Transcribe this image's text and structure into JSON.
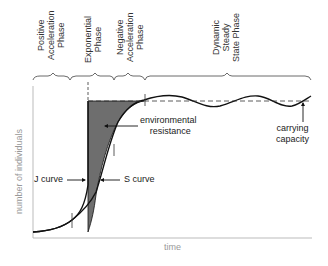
{
  "diagram": {
    "phases": [
      {
        "id": "positive-acceleration",
        "lines": [
          "Positive",
          "Acceleration",
          "Phase"
        ]
      },
      {
        "id": "exponential",
        "lines": [
          "Exponential",
          "Phase"
        ]
      },
      {
        "id": "negative-acceleration",
        "lines": [
          "Negative",
          "Acceleration",
          "Phase"
        ]
      },
      {
        "id": "dynamic-steady-state",
        "lines": [
          "Dynamic",
          "Steady",
          "State Phase"
        ]
      }
    ],
    "labels": {
      "environmental_resistance_1": "environmental",
      "environmental_resistance_2": "resistance",
      "carrying_capacity_1": "carrying",
      "carrying_capacity_2": "capacity",
      "j_curve": "J curve",
      "s_curve": "S curve"
    },
    "axes": {
      "x_label": "time",
      "y_label": "number of individuals"
    },
    "colors": {
      "shaded_region": "#6e6e6e",
      "curve": "#111111",
      "axis": "#bbbbbb",
      "axis_label": "#999999"
    }
  }
}
